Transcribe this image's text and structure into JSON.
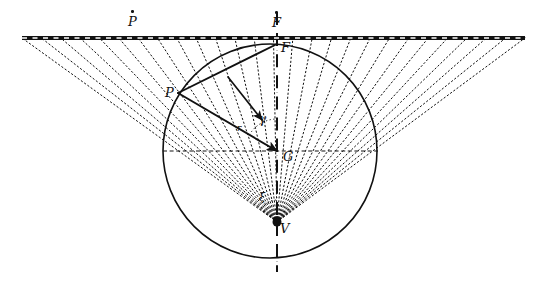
{
  "figure": {
    "background_color": "#ffffff",
    "ink_color": "#111111",
    "width": 539,
    "height": 281
  },
  "labels": {
    "f_dot": "F",
    "f_plain": "F",
    "p_dot": "P",
    "p_plain": "P",
    "g": "G",
    "v": "V",
    "gamma": "γ",
    "xi": "ξ",
    "r_vector": "r"
  },
  "geometry": {
    "baseline": {
      "name": "horizontal-dash-dot-line",
      "x1": 22,
      "y1": 38,
      "x2": 525,
      "y2": 38,
      "style": "thick-dash-dot",
      "stroke_width": 4
    },
    "axis": {
      "name": "vertical-dash-dot-axis",
      "x": 277,
      "y1": 12,
      "y2": 272,
      "style": "dash-dot",
      "stroke_width": 2
    },
    "circle": {
      "name": "main-circle",
      "cx": 270,
      "cy": 151,
      "r": 107,
      "stroke_width": 1.6
    },
    "diameter": {
      "name": "horizontal-diameter",
      "x1": 163,
      "y1": 151,
      "x2": 378,
      "y2": 151,
      "style": "dashed"
    },
    "vertex": {
      "name": "vertex-V",
      "x": 277,
      "y": 222,
      "dot_r": 4.5
    },
    "point_F": {
      "x": 277,
      "y": 44
    },
    "point_G": {
      "x": 277,
      "y": 151
    },
    "point_P": {
      "x": 178,
      "y": 93
    },
    "fan": {
      "name": "dotted-ray-fan",
      "count": 27,
      "apex_x": 277,
      "apex_y": 222,
      "spread_left_x": 22,
      "spread_right_x": 525,
      "target_y": 38,
      "style": "dotted"
    },
    "solid_rays": [
      {
        "name": "ray-F-to-P",
        "x1": 277,
        "y1": 44,
        "x2": 178,
        "y2": 93
      },
      {
        "name": "arrow-P-to-G",
        "x1": 178,
        "y1": 93,
        "x2": 277,
        "y2": 151
      },
      {
        "name": "arrow-F-down-right",
        "x1": 228,
        "y1": 77,
        "x2": 262,
        "y2": 120
      }
    ],
    "angle_marks": [
      {
        "name": "gamma-angle-arc",
        "cx": 277,
        "cy": 151,
        "r": 32,
        "from_deg": 210,
        "to_deg": 268
      },
      {
        "name": "xi-angle-arc",
        "cx": 277,
        "cy": 222,
        "r": 22,
        "from_deg": 235,
        "to_deg": 272
      }
    ]
  }
}
